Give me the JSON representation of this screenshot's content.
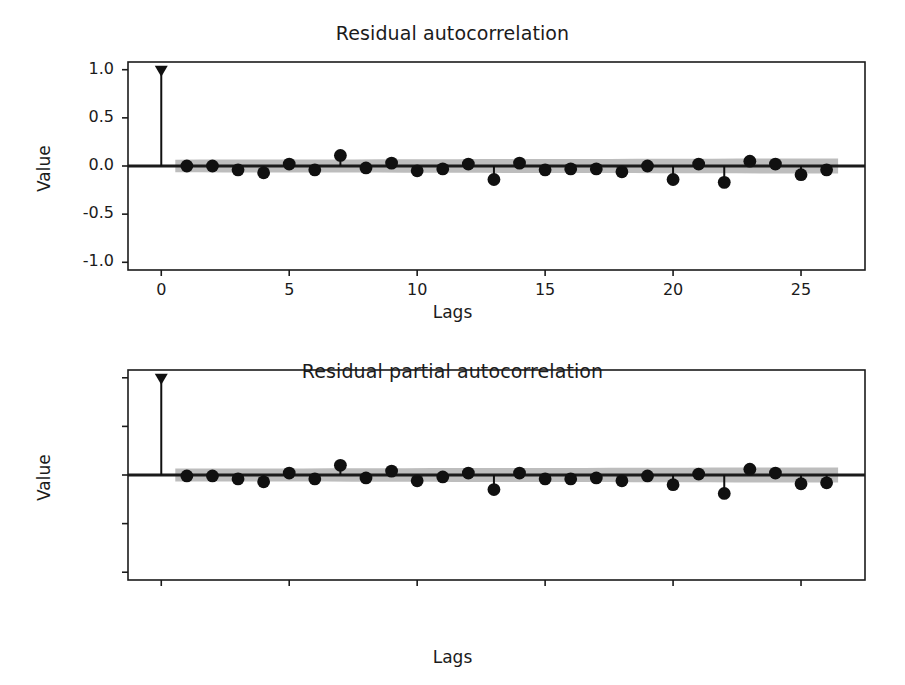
{
  "figure": {
    "width": 905,
    "height": 685,
    "background": "#ffffff",
    "marker_color": "#101010",
    "stem_color": "#101010",
    "band_color": "#b9b9b9",
    "axis_color": "#1b1b1b"
  },
  "panels": {
    "acf": {
      "title": "Residual autocorrelation",
      "xlabel": "Lags",
      "ylabel": "Value"
    },
    "pacf": {
      "title": "Residual partial autocorrelation",
      "xlabel": "Lags",
      "ylabel": "Value"
    }
  },
  "axis": {
    "ytick_labels": [
      "1.0",
      "0.5",
      "0.0",
      "-0.5",
      "-1.0"
    ],
    "ytick_values": [
      1.0,
      0.5,
      0.0,
      -0.5,
      -1.0
    ],
    "xtick_labels": [
      "0",
      "5",
      "10",
      "15",
      "20",
      "25"
    ],
    "xtick_values": [
      0,
      5,
      10,
      15,
      20,
      25
    ]
  },
  "chart_data": [
    {
      "type": "line",
      "plot_style": "stem",
      "title": "Residual autocorrelation",
      "xlabel": "Lags",
      "ylabel": "Value",
      "xlim": [
        -1.3,
        27.5
      ],
      "ylim": [
        -1.08,
        1.08
      ],
      "grid": false,
      "legend": "none",
      "x": [
        0,
        1,
        2,
        3,
        4,
        5,
        6,
        7,
        8,
        9,
        10,
        11,
        12,
        13,
        14,
        15,
        16,
        17,
        18,
        19,
        20,
        21,
        22,
        23,
        24,
        25,
        26
      ],
      "values": [
        1.0,
        0.0,
        0.0,
        -0.04,
        -0.07,
        0.02,
        -0.04,
        0.11,
        -0.02,
        0.03,
        -0.05,
        -0.03,
        0.02,
        -0.14,
        0.03,
        -0.04,
        -0.03,
        -0.03,
        -0.06,
        0.0,
        -0.14,
        0.02,
        -0.17,
        0.05,
        0.02,
        -0.09,
        -0.04
      ],
      "annotations": [
        {
          "label": "confidence band upper at lag 1",
          "value": 0.065
        },
        {
          "label": "confidence band upper at lag 26",
          "value": 0.075
        },
        {
          "label": "confidence band lower at lag 1",
          "value": -0.065
        },
        {
          "label": "confidence band lower at lag 26",
          "value": -0.075
        }
      ]
    },
    {
      "type": "line",
      "plot_style": "stem",
      "title": "Residual partial autocorrelation",
      "xlabel": "Lags",
      "ylabel": "Value",
      "xlim": [
        -1.3,
        27.5
      ],
      "ylim": [
        -1.08,
        1.08
      ],
      "grid": false,
      "legend": "none",
      "x": [
        0,
        1,
        2,
        3,
        4,
        5,
        6,
        7,
        8,
        9,
        10,
        11,
        12,
        13,
        14,
        15,
        16,
        17,
        18,
        19,
        20,
        21,
        22,
        23,
        24,
        25,
        26
      ],
      "values": [
        1.0,
        -0.01,
        -0.01,
        -0.04,
        -0.07,
        0.02,
        -0.04,
        0.1,
        -0.03,
        0.04,
        -0.06,
        -0.02,
        0.02,
        -0.15,
        0.02,
        -0.04,
        -0.04,
        -0.03,
        -0.06,
        -0.01,
        -0.1,
        0.01,
        -0.19,
        0.06,
        0.02,
        -0.09,
        -0.08
      ],
      "annotations": [
        {
          "label": "confidence band upper at lag 1",
          "value": 0.065
        },
        {
          "label": "confidence band upper at lag 26",
          "value": 0.075
        },
        {
          "label": "confidence band lower at lag 1",
          "value": -0.065
        },
        {
          "label": "confidence band lower at lag 26",
          "value": -0.075
        }
      ]
    }
  ]
}
